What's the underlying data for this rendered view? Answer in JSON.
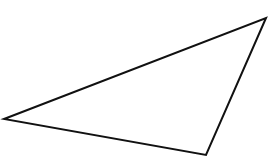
{
  "diagram": {
    "type": "triangle",
    "stroke_color": "#111111",
    "fill_color": "none",
    "stroke_width": 2,
    "vertices": [
      {
        "x": 4,
        "y": 119
      },
      {
        "x": 266,
        "y": 18
      },
      {
        "x": 206,
        "y": 155
      }
    ]
  }
}
